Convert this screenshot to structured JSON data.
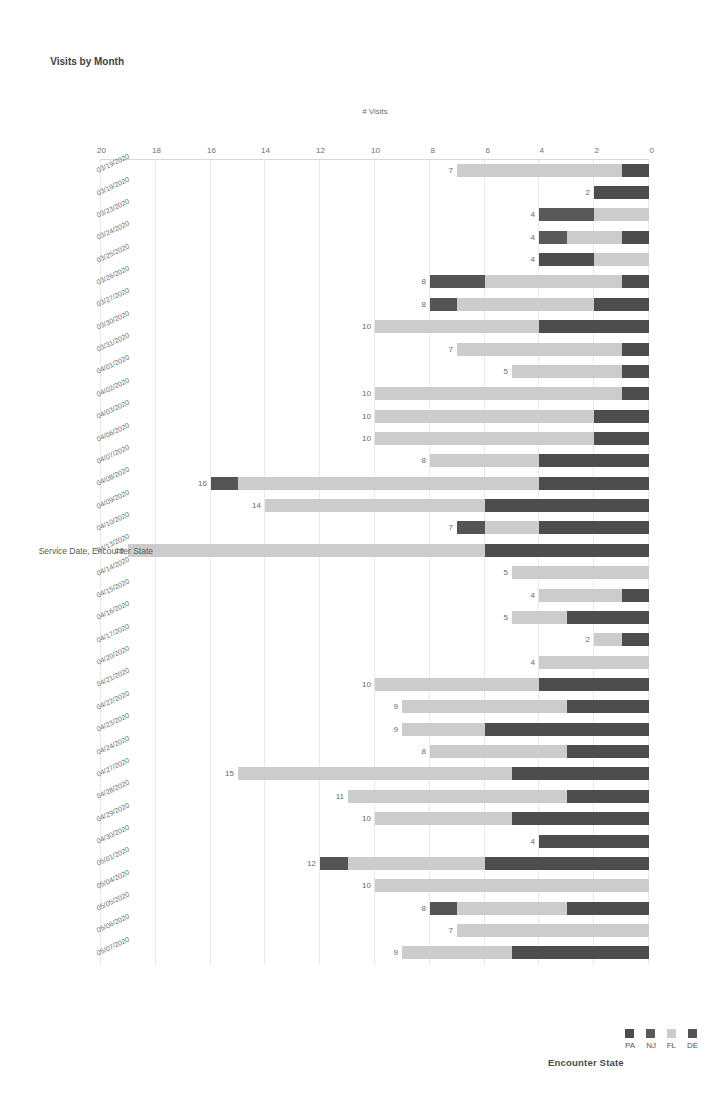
{
  "chart": {
    "title": "Visits by Month",
    "legend": {
      "title": "Encounter State",
      "position": "top-right",
      "items": [
        {
          "label": "DE",
          "color": "#555555"
        },
        {
          "label": "FL",
          "color": "#cccccc"
        },
        {
          "label": "NJ",
          "color": "#595959"
        },
        {
          "label": "PA",
          "color": "#4d4d4d"
        }
      ]
    }
  },
  "chart_data": {
    "type": "bar",
    "orientation": "horizontal-stacked",
    "title": "Visits by Month",
    "xlabel": "# Visits",
    "ylabel": "Service Date, Encounter State",
    "xlim": [
      0,
      20
    ],
    "xticks": [
      0,
      2,
      4,
      6,
      8,
      10,
      12,
      14,
      16,
      18,
      20
    ],
    "grid": true,
    "legend_title": "Encounter State",
    "series": [
      {
        "name": "DE",
        "color": "#555555"
      },
      {
        "name": "FL",
        "color": "#cccccc"
      },
      {
        "name": "NJ",
        "color": "#595959"
      },
      {
        "name": "PA",
        "color": "#4d4d4d"
      }
    ],
    "categories": [
      "05/07/2020",
      "05/06/2020",
      "05/05/2020",
      "05/04/2020",
      "05/01/2020",
      "04/30/2020",
      "04/29/2020",
      "04/28/2020",
      "04/27/2020",
      "04/24/2020",
      "04/23/2020",
      "04/22/2020",
      "04/21/2020",
      "04/20/2020",
      "04/17/2020",
      "04/16/2020",
      "04/15/2020",
      "04/14/2020",
      "04/13/2020",
      "04/10/2020",
      "04/09/2020",
      "04/08/2020",
      "04/07/2020",
      "04/06/2020",
      "04/03/2020",
      "04/02/2020",
      "04/01/2020",
      "03/31/2020",
      "03/30/2020",
      "03/27/2020",
      "03/26/2020",
      "03/25/2020",
      "03/24/2020",
      "03/23/2020",
      "03/19/2020"
    ],
    "totals": [
      9,
      7,
      8,
      10,
      12,
      4,
      10,
      11,
      15,
      8,
      9,
      9,
      10,
      4,
      2,
      5,
      4,
      5,
      19,
      7,
      14,
      16,
      8,
      10,
      10,
      10,
      5,
      7,
      10,
      8,
      8,
      4,
      4,
      4,
      2,
      7
    ],
    "rows": [
      {
        "date": "05/07/2020",
        "total": 9,
        "stack": [
          {
            "state": "PA",
            "value": 5
          },
          {
            "state": "FL",
            "value": 4
          }
        ]
      },
      {
        "date": "05/06/2020",
        "total": 7,
        "stack": [
          {
            "state": "FL",
            "value": 7
          }
        ]
      },
      {
        "date": "05/05/2020",
        "total": 8,
        "stack": [
          {
            "state": "PA",
            "value": 3
          },
          {
            "state": "FL",
            "value": 4
          },
          {
            "state": "DE",
            "value": 1
          }
        ]
      },
      {
        "date": "05/04/2020",
        "total": 10,
        "stack": [
          {
            "state": "FL",
            "value": 10
          }
        ]
      },
      {
        "date": "05/01/2020",
        "total": 12,
        "stack": [
          {
            "state": "PA",
            "value": 6
          },
          {
            "state": "FL",
            "value": 5
          },
          {
            "state": "DE",
            "value": 1
          }
        ]
      },
      {
        "date": "04/30/2020",
        "total": 4,
        "stack": [
          {
            "state": "PA",
            "value": 4
          }
        ]
      },
      {
        "date": "04/29/2020",
        "total": 10,
        "stack": [
          {
            "state": "PA",
            "value": 5
          },
          {
            "state": "FL",
            "value": 5
          }
        ]
      },
      {
        "date": "04/28/2020",
        "total": 11,
        "stack": [
          {
            "state": "PA",
            "value": 3
          },
          {
            "state": "FL",
            "value": 8
          }
        ]
      },
      {
        "date": "04/27/2020",
        "total": 15,
        "stack": [
          {
            "state": "PA",
            "value": 5
          },
          {
            "state": "FL",
            "value": 10
          }
        ]
      },
      {
        "date": "04/24/2020",
        "total": 8,
        "stack": [
          {
            "state": "PA",
            "value": 3
          },
          {
            "state": "FL",
            "value": 5
          }
        ]
      },
      {
        "date": "04/23/2020",
        "total": 9,
        "stack": [
          {
            "state": "PA",
            "value": 6
          },
          {
            "state": "FL",
            "value": 3
          }
        ]
      },
      {
        "date": "04/22/2020",
        "total": 9,
        "stack": [
          {
            "state": "PA",
            "value": 3
          },
          {
            "state": "FL",
            "value": 6
          }
        ]
      },
      {
        "date": "04/21/2020",
        "total": 10,
        "stack": [
          {
            "state": "PA",
            "value": 4
          },
          {
            "state": "FL",
            "value": 6
          }
        ]
      },
      {
        "date": "04/20/2020",
        "total": 4,
        "stack": [
          {
            "state": "FL",
            "value": 4
          }
        ]
      },
      {
        "date": "04/17/2020",
        "total": 2,
        "stack": [
          {
            "state": "PA",
            "value": 1
          },
          {
            "state": "FL",
            "value": 1
          }
        ]
      },
      {
        "date": "04/16/2020",
        "total": 5,
        "stack": [
          {
            "state": "PA",
            "value": 3
          },
          {
            "state": "FL",
            "value": 2
          }
        ]
      },
      {
        "date": "04/15/2020",
        "total": 4,
        "stack": [
          {
            "state": "PA",
            "value": 1
          },
          {
            "state": "FL",
            "value": 3
          }
        ]
      },
      {
        "date": "04/14/2020",
        "total": 5,
        "stack": [
          {
            "state": "FL",
            "value": 5
          }
        ]
      },
      {
        "date": "04/13/2020",
        "total": 19,
        "stack": [
          {
            "state": "PA",
            "value": 6
          },
          {
            "state": "FL",
            "value": 13
          }
        ]
      },
      {
        "date": "04/10/2020",
        "total": 7,
        "stack": [
          {
            "state": "PA",
            "value": 4
          },
          {
            "state": "FL",
            "value": 2
          },
          {
            "state": "DE",
            "value": 1
          }
        ]
      },
      {
        "date": "04/09/2020",
        "total": 14,
        "stack": [
          {
            "state": "PA",
            "value": 6
          },
          {
            "state": "FL",
            "value": 8
          }
        ]
      },
      {
        "date": "04/08/2020",
        "total": 16,
        "stack": [
          {
            "state": "PA",
            "value": 4
          },
          {
            "state": "FL",
            "value": 11
          },
          {
            "state": "DE",
            "value": 1
          }
        ]
      },
      {
        "date": "04/07/2020",
        "total": 8,
        "stack": [
          {
            "state": "PA",
            "value": 4
          },
          {
            "state": "FL",
            "value": 4
          }
        ]
      },
      {
        "date": "04/06/2020",
        "total": 10,
        "stack": [
          {
            "state": "PA",
            "value": 2
          },
          {
            "state": "FL",
            "value": 8
          }
        ]
      },
      {
        "date": "04/03/2020",
        "total": 10,
        "stack": [
          {
            "state": "PA",
            "value": 2
          },
          {
            "state": "FL",
            "value": 8
          }
        ]
      },
      {
        "date": "04/02/2020",
        "total": 10,
        "stack": [
          {
            "state": "PA",
            "value": 1
          },
          {
            "state": "FL",
            "value": 9
          }
        ]
      },
      {
        "date": "04/01/2020",
        "total": 5,
        "stack": [
          {
            "state": "PA",
            "value": 1
          },
          {
            "state": "FL",
            "value": 4
          }
        ]
      },
      {
        "date": "03/31/2020",
        "total": 7,
        "stack": [
          {
            "state": "PA",
            "value": 1
          },
          {
            "state": "FL",
            "value": 6
          }
        ]
      },
      {
        "date": "03/30/2020",
        "total": 10,
        "stack": [
          {
            "state": "PA",
            "value": 4
          },
          {
            "state": "FL",
            "value": 6
          }
        ]
      },
      {
        "date": "03/27/2020",
        "total": 8,
        "stack": [
          {
            "state": "PA",
            "value": 2
          },
          {
            "state": "FL",
            "value": 5
          },
          {
            "state": "DE",
            "value": 1
          }
        ]
      },
      {
        "date": "03/26/2020",
        "total": 8,
        "stack": [
          {
            "state": "PA",
            "value": 1
          },
          {
            "state": "FL",
            "value": 5
          },
          {
            "state": "DE",
            "value": 2
          }
        ]
      },
      {
        "date": "03/25/2020",
        "total": 4,
        "stack": [
          {
            "state": "FL",
            "value": 2
          },
          {
            "state": "PA",
            "value": 2
          }
        ]
      },
      {
        "date": "03/24/2020",
        "total": 4,
        "stack": [
          {
            "state": "PA",
            "value": 1
          },
          {
            "state": "FL",
            "value": 2
          },
          {
            "state": "NJ",
            "value": 1
          }
        ]
      },
      {
        "date": "03/23/2020",
        "total": 4,
        "stack": [
          {
            "state": "FL",
            "value": 2
          },
          {
            "state": "NJ",
            "value": 2
          }
        ]
      },
      {
        "date": "03/19/2020",
        "total": 2,
        "stack": [
          {
            "state": "PA",
            "value": 2
          }
        ]
      },
      {
        "date": "03/19/2020",
        "total": 7,
        "stack": [
          {
            "state": "PA",
            "value": 1
          },
          {
            "state": "FL",
            "value": 6
          }
        ]
      }
    ]
  }
}
